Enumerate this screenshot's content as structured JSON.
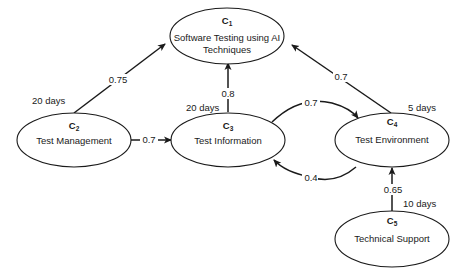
{
  "nodes": [
    {
      "id": "C",
      "sub": "1",
      "label_line1": "Software Testing using AI",
      "label_line2": "Techniques",
      "duration": ""
    },
    {
      "id": "C",
      "sub": "2",
      "label_line1": "Test Management",
      "label_line2": "",
      "duration": "20 days"
    },
    {
      "id": "C",
      "sub": "3",
      "label_line1": "Test Information",
      "label_line2": "",
      "duration": "20 days"
    },
    {
      "id": "C",
      "sub": "4",
      "label_line1": "Test Environment",
      "label_line2": "",
      "duration": "5 days"
    },
    {
      "id": "C",
      "sub": "5",
      "label_line1": "Technical Support",
      "label_line2": "",
      "duration": "10 days"
    }
  ],
  "edges": [
    {
      "from": "C2",
      "to": "C1",
      "weight": "0.75"
    },
    {
      "from": "C3",
      "to": "C1",
      "weight": "0.8"
    },
    {
      "from": "C4",
      "to": "C1",
      "weight": "0.7"
    },
    {
      "from": "C2",
      "to": "C3",
      "weight": "0.7"
    },
    {
      "from": "C3",
      "to": "C4",
      "weight": "0.7"
    },
    {
      "from": "C4",
      "to": "C3",
      "weight": "0.4"
    },
    {
      "from": "C5",
      "to": "C4",
      "weight": "0.65"
    }
  ]
}
